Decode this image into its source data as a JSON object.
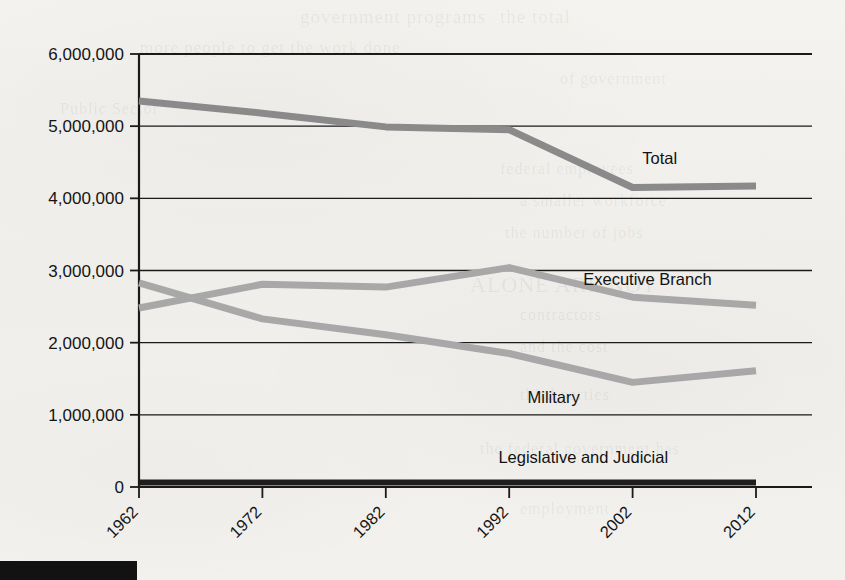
{
  "chart_data": {
    "type": "line",
    "title": "",
    "subtitle": "",
    "xlabel": "",
    "ylabel": "",
    "x": [
      1962,
      1972,
      1982,
      1992,
      2002,
      2012
    ],
    "categories": [
      "1962",
      "1972",
      "1982",
      "1992",
      "2002",
      "2012"
    ],
    "xlim": [
      1962,
      2012
    ],
    "ylim": [
      0,
      6000000
    ],
    "y_ticks": [
      0,
      1000000,
      2000000,
      3000000,
      4000000,
      5000000,
      6000000
    ],
    "y_tick_labels": [
      "0",
      "1,000,000",
      "2,000,000",
      "3,000,000",
      "4,000,000",
      "5,000,000",
      "6,000,000"
    ],
    "x_tick_labels": [
      "1962",
      "1972",
      "1982",
      "1992",
      "2002",
      "2012"
    ],
    "x_tick_label_rotation": -45,
    "grid": "horizontal",
    "legend": "inline-labels",
    "series": [
      {
        "name": "Total",
        "label": "Total",
        "color": "#8a8a8a",
        "width": 7,
        "values": [
          5350000,
          5180000,
          4990000,
          4950000,
          4150000,
          4170000
        ],
        "label_x": 2004.2,
        "label_y": 4480000
      },
      {
        "name": "Executive Branch",
        "label": "Executive Branch",
        "color": "#a8a8a8",
        "width": 7,
        "values": [
          2480000,
          2810000,
          2770000,
          3040000,
          2630000,
          2520000
        ],
        "label_x": 2003.2,
        "label_y": 2800000
      },
      {
        "name": "Military",
        "label": "Military",
        "color": "#a8a8a8",
        "width": 7,
        "values": [
          2830000,
          2330000,
          2110000,
          1850000,
          1450000,
          1610000
        ],
        "label_x": 1995.6,
        "label_y": 1160000
      },
      {
        "name": "Legislative and Judicial",
        "label": "Legislative and Judicial",
        "color": "#1e1e1e",
        "width": 6,
        "values": [
          64000,
          64000,
          64000,
          64000,
          64000,
          64000
        ],
        "label_x": 1998.0,
        "label_y": 330000
      }
    ]
  },
  "page": {
    "bottom_bar_color": "#121212",
    "background_color": "#f2f1ee",
    "axis_color": "#1a1a1a",
    "ghost_text": [
      {
        "text": "government programs",
        "x": 300,
        "y": 6,
        "size": 19
      },
      {
        "text": "the total",
        "x": 500,
        "y": 6,
        "size": 19
      },
      {
        "text": "more people to get the work done",
        "x": 140,
        "y": 38,
        "size": 17
      },
      {
        "text": "of government",
        "x": 560,
        "y": 70,
        "size": 16
      },
      {
        "text": "Public Sector",
        "x": 60,
        "y": 100,
        "size": 16
      },
      {
        "text": "federal employees",
        "x": 500,
        "y": 160,
        "size": 16
      },
      {
        "text": "a smaller workforce",
        "x": 520,
        "y": 192,
        "size": 16
      },
      {
        "text": "the number of jobs",
        "x": 505,
        "y": 224,
        "size": 16
      },
      {
        "text": "ALONE ARE NOT",
        "x": 470,
        "y": 272,
        "size": 22
      },
      {
        "text": "contractors",
        "x": 520,
        "y": 306,
        "size": 16
      },
      {
        "text": "and the cost",
        "x": 520,
        "y": 338,
        "size": 16
      },
      {
        "text": "third parties",
        "x": 520,
        "y": 386,
        "size": 16
      },
      {
        "text": "the federal government has",
        "x": 480,
        "y": 440,
        "size": 16
      },
      {
        "text": "employment",
        "x": 520,
        "y": 500,
        "size": 16
      }
    ]
  }
}
